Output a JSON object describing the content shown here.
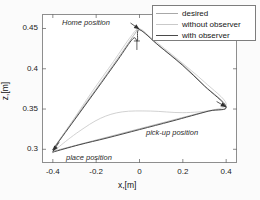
{
  "chart_data": {
    "type": "line",
    "title": "",
    "xlabel": "x,[m]",
    "ylabel": "z,[m]",
    "xlim": [
      -0.45,
      0.45
    ],
    "ylim": [
      0.283,
      0.468
    ],
    "xticks": [
      -0.4,
      -0.2,
      0,
      0.2,
      0.4
    ],
    "xtick_labels": [
      "-0.4",
      "-0.2",
      "0",
      "0.2",
      "0.4"
    ],
    "yticks": [
      0.3,
      0.35,
      0.4,
      0.45
    ],
    "ytick_labels": [
      "0.3",
      "0.35",
      "0.4",
      "0.45"
    ],
    "grid": false,
    "legend_position": "top-right",
    "series": [
      {
        "name": "desired",
        "color": "#a8a8a8",
        "points": [
          [
            -0.4,
            0.3
          ],
          [
            -0.3,
            0.338
          ],
          [
            -0.2,
            0.375
          ],
          [
            -0.1,
            0.413
          ],
          [
            -0.02,
            0.444
          ],
          [
            0.0,
            0.449
          ],
          [
            0.08,
            0.431
          ],
          [
            0.2,
            0.405
          ],
          [
            0.3,
            0.379
          ],
          [
            0.4,
            0.353
          ],
          [
            0.3,
            0.3465
          ],
          [
            0.1,
            0.3325
          ],
          [
            -0.1,
            0.3185
          ],
          [
            -0.25,
            0.308
          ],
          [
            -0.4,
            0.2975
          ]
        ]
      },
      {
        "name": "without observer",
        "color": "#c9c9c9",
        "points": [
          [
            -0.4,
            0.3
          ],
          [
            -0.32,
            0.331
          ],
          [
            -0.22,
            0.371
          ],
          [
            -0.12,
            0.409
          ],
          [
            -0.04,
            0.44
          ],
          [
            0.0,
            0.4495
          ],
          [
            0.06,
            0.437
          ],
          [
            0.18,
            0.411
          ],
          [
            0.3,
            0.3835
          ],
          [
            0.4,
            0.357
          ],
          [
            0.33,
            0.3485
          ],
          [
            0.2,
            0.3455
          ],
          [
            0.05,
            0.3475
          ],
          [
            -0.08,
            0.3465
          ],
          [
            -0.18,
            0.3385
          ],
          [
            -0.28,
            0.322
          ],
          [
            -0.37,
            0.3035
          ],
          [
            -0.4,
            0.2955
          ]
        ]
      },
      {
        "name": "with observer",
        "color": "#4a4a4a",
        "points": [
          [
            -0.4,
            0.2995
          ],
          [
            -0.3,
            0.3365
          ],
          [
            -0.2,
            0.3735
          ],
          [
            -0.1,
            0.411
          ],
          [
            -0.03,
            0.4375
          ],
          [
            -0.01,
            0.4345
          ],
          [
            0.0,
            0.4485
          ],
          [
            0.09,
            0.4285
          ],
          [
            0.2,
            0.404
          ],
          [
            0.3,
            0.3785
          ],
          [
            0.4,
            0.3525
          ],
          [
            0.32,
            0.3475
          ],
          [
            0.15,
            0.335
          ],
          [
            0.0,
            0.3245
          ],
          [
            -0.15,
            0.314
          ],
          [
            -0.28,
            0.3055
          ],
          [
            -0.4,
            0.2965
          ]
        ]
      }
    ],
    "annotations": [
      {
        "text": "Home position",
        "x": -0.12,
        "y": 0.463
      },
      {
        "text": "pick-up position",
        "x": 0.17,
        "y": 0.3105
      },
      {
        "text": "place position",
        "x": -0.145,
        "y": 0.2925
      }
    ],
    "arrow_markers": [
      {
        "at": [
          0.0,
          0.449
        ],
        "label": "apex-arrow"
      },
      {
        "at": [
          -0.4,
          0.2975
        ],
        "label": "place-arrow"
      },
      {
        "at": [
          0.4,
          0.3525
        ],
        "label": "pickup-arrow"
      }
    ]
  },
  "legend": {
    "entries": [
      {
        "label": "desired",
        "color": "#a8a8a8"
      },
      {
        "label": "without observer",
        "color": "#c9c9c9"
      },
      {
        "label": "with observer",
        "color": "#4a4a4a"
      }
    ]
  }
}
